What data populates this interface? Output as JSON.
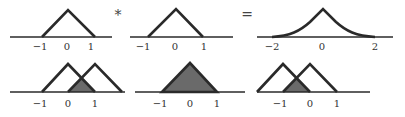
{
  "diagram": {
    "top_row": {
      "panel_1": {
        "shape": "triangle",
        "ticks": [
          "−1",
          "0",
          "1"
        ]
      },
      "operator_1": "*",
      "panel_2": {
        "shape": "triangle",
        "ticks": [
          "−1",
          "0",
          "1"
        ]
      },
      "operator_2": "=",
      "panel_3": {
        "shape": "smooth-peak (convolution result)",
        "ticks": [
          "−2",
          "0",
          "2"
        ]
      }
    },
    "bottom_row": {
      "panel_1": {
        "shape": "two overlapping triangles, shift +1/2",
        "ticks": [
          "−1",
          "0",
          "1"
        ]
      },
      "panel_2": {
        "shape": "fully overlapping triangle (shaded)",
        "ticks": [
          "−1",
          "0",
          "1"
        ]
      },
      "panel_3": {
        "shape": "two overlapping triangles, shift −1/2",
        "ticks": [
          "−1",
          "0",
          "1"
        ]
      }
    },
    "colors": {
      "line": "#2a2a2a",
      "shade": "#6a6a6a",
      "background": "#ffffff"
    }
  }
}
